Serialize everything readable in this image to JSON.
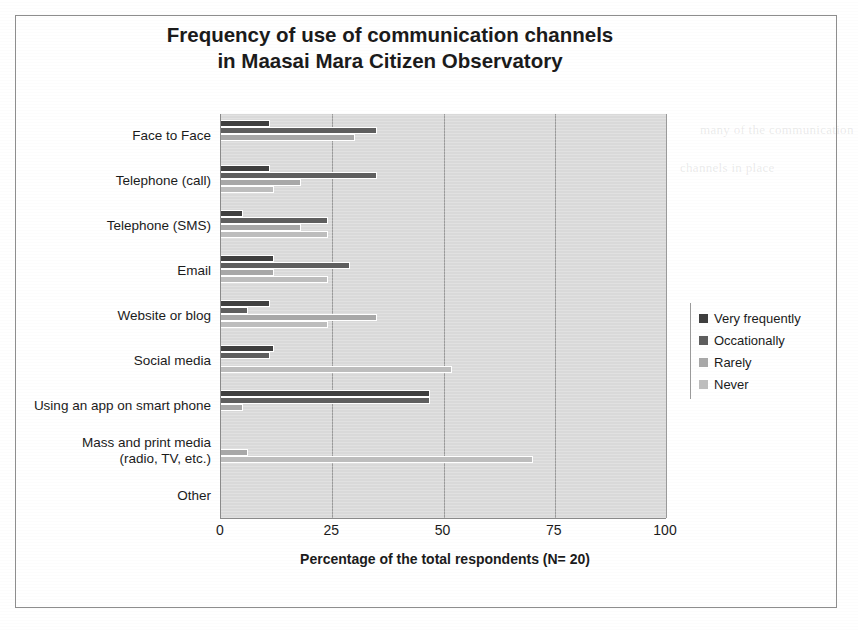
{
  "chart_data": {
    "type": "bar",
    "orientation": "horizontal",
    "title": "Frequency of use of communication channels in Maasai Mara Citizen Observatory",
    "title_lines": [
      "Frequency of use of communication channels",
      "in Maasai Mara Citizen Observatory"
    ],
    "xlabel": "Percentage of the total respondents  (N= 20)",
    "ylabel": "",
    "xlim": [
      0,
      100
    ],
    "xticks": [
      0,
      25,
      50,
      75,
      100
    ],
    "xtick_labels": [
      "0",
      "25",
      "50",
      "75",
      "100"
    ],
    "grid": "vertical",
    "legend_position": "right",
    "categories": [
      "Face to Face",
      "Telephone (call)",
      "Telephone (SMS)",
      "Email",
      "Website or blog",
      "Social media",
      "Using an app on smart phone",
      "Mass and print media (radio, TV, etc.)",
      "Other"
    ],
    "category_label_lines": [
      [
        "Face to Face"
      ],
      [
        "Telephone (call)"
      ],
      [
        "Telephone (SMS)"
      ],
      [
        "Email"
      ],
      [
        "Website or blog"
      ],
      [
        "Social media"
      ],
      [
        "Using an app on smart phone"
      ],
      [
        "Mass and print media",
        "(radio, TV, etc.)"
      ],
      [
        "Other"
      ]
    ],
    "series": [
      {
        "name": "Very frequently",
        "color": "#3f3f3f",
        "values": [
          11,
          11,
          5,
          12,
          11,
          12,
          47,
          0,
          0
        ]
      },
      {
        "name": "Occationally",
        "color": "#5e5e5e",
        "values": [
          35,
          35,
          24,
          29,
          6,
          11,
          47,
          0,
          0
        ]
      },
      {
        "name": "Rarely",
        "color": "#a8a8a8",
        "values": [
          30,
          18,
          18,
          12,
          35,
          0,
          5,
          6,
          0
        ]
      },
      {
        "name": "Never",
        "color": "#bdbdbd",
        "values": [
          0,
          12,
          24,
          24,
          24,
          52,
          0,
          70,
          0
        ]
      }
    ]
  },
  "page_ghost_text": [
    "many of the communication",
    "channels in place",
    "communication is preferred",
    "respondents",
    "to be feasible",
    "data collection"
  ]
}
